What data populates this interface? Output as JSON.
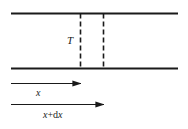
{
  "figure": {
    "name": "string-element-tension-diagram",
    "width": 188,
    "height": 129,
    "background_color": "#ffffff",
    "stroke_color": "#1a1a1a"
  },
  "labels": {
    "tension": "T",
    "position": "x",
    "position_plus_increment_var1": "x",
    "position_plus_increment_op": "+d",
    "position_plus_increment_var2": "x",
    "position_plus_increment_full": "x+dx"
  },
  "geometry": {
    "top_rail": {
      "x1": 11,
      "y1": 13.5,
      "x2": 178,
      "y2": 13.5,
      "stroke_width": 2.2
    },
    "bottom_rail": {
      "x1": 11,
      "y1": 68.5,
      "x2": 178,
      "y2": 68.5,
      "stroke_width": 2.2
    },
    "dashed_line_left": {
      "x": 80.5,
      "y1": 13.5,
      "y2": 68.5,
      "stroke_width": 1.6,
      "dash": "5 3"
    },
    "dashed_line_right": {
      "x": 103.5,
      "y1": 13.5,
      "y2": 68.5,
      "stroke_width": 1.6,
      "dash": "5 3"
    },
    "arrow_x": {
      "x1": 11,
      "y": 83.5,
      "x2": 81,
      "stroke_width": 1.1
    },
    "arrow_x_plus_dx": {
      "x1": 11,
      "y": 104.5,
      "x2": 104,
      "stroke_width": 1.1
    }
  }
}
